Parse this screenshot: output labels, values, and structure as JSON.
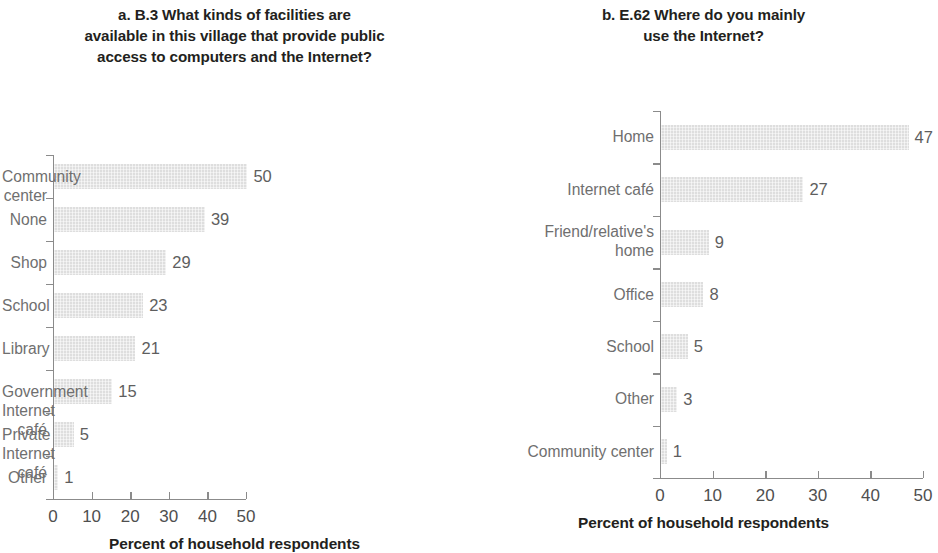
{
  "figure": {
    "background": "#ffffff",
    "bar_color": "#dedede",
    "label_color": "#6f6f6f",
    "axis_color": "#8b8b8b",
    "title_color": "#231f20"
  },
  "panels": [
    {
      "id": "panel-a",
      "title": "a. B.3 What kinds of facilities are\navailable in this village that provide public\naccess to computers and the Internet?",
      "axis_title": "Percent of household respondents",
      "xticks": [
        "0",
        "10",
        "20",
        "30",
        "40",
        "50"
      ],
      "categories": [
        "Community center",
        "None",
        "Shop",
        "School",
        "Library",
        "Government Internet café",
        "Private Internet café",
        "Other"
      ],
      "values": [
        50,
        39,
        29,
        23,
        21,
        15,
        5,
        1
      ],
      "value_labels": [
        "50",
        "39",
        "29",
        "23",
        "21",
        "15",
        "5",
        "1"
      ]
    },
    {
      "id": "panel-b",
      "title": "b. E.62 Where do you mainly\nuse the Internet?",
      "axis_title": "Percent of household respondents",
      "xticks": [
        "0",
        "10",
        "20",
        "30",
        "40",
        "50"
      ],
      "categories": [
        "Home",
        "Internet café",
        "Friend/relative's\nhome",
        "Office",
        "School",
        "Other",
        "Community center"
      ],
      "values": [
        47,
        27,
        9,
        8,
        5,
        3,
        1
      ],
      "value_labels": [
        "47",
        "27",
        "9",
        "8",
        "5",
        "3",
        "1"
      ]
    }
  ],
  "chart_data": [
    {
      "type": "bar",
      "orientation": "horizontal",
      "title": "a. B.3 What kinds of facilities are available in this village that provide public access to computers and the Internet?",
      "xlabel": "Percent of household respondents",
      "ylabel": "",
      "xlim": [
        0,
        50
      ],
      "xticks": [
        0,
        10,
        20,
        30,
        40,
        50
      ],
      "grid": false,
      "legend": false,
      "categories": [
        "Community center",
        "None",
        "Shop",
        "School",
        "Library",
        "Government Internet café",
        "Private Internet café",
        "Other"
      ],
      "values": [
        50,
        39,
        29,
        23,
        21,
        15,
        5,
        1
      ],
      "data_labels": [
        "50",
        "39",
        "29",
        "23",
        "21",
        "15",
        "5",
        "1"
      ]
    },
    {
      "type": "bar",
      "orientation": "horizontal",
      "title": "b. E.62 Where do you mainly use the Internet?",
      "xlabel": "Percent of household respondents",
      "ylabel": "",
      "xlim": [
        0,
        50
      ],
      "xticks": [
        0,
        10,
        20,
        30,
        40,
        50
      ],
      "grid": false,
      "legend": false,
      "categories": [
        "Home",
        "Internet café",
        "Friend/relative's home",
        "Office",
        "School",
        "Other",
        "Community center"
      ],
      "values": [
        47,
        27,
        9,
        8,
        5,
        3,
        1
      ],
      "data_labels": [
        "47",
        "27",
        "9",
        "8",
        "5",
        "3",
        "1"
      ]
    }
  ]
}
